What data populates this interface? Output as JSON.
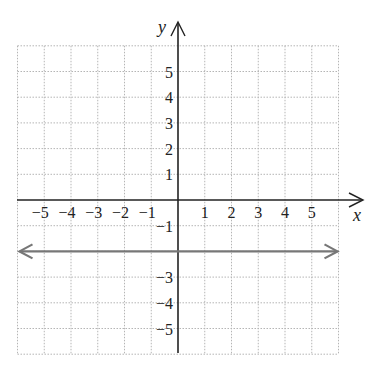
{
  "chart_data": {
    "type": "line",
    "title": "",
    "xlabel": "x",
    "ylabel": "y",
    "xlim": [
      -6,
      6
    ],
    "ylim": [
      -6,
      6
    ],
    "grid": true,
    "grid_style": "dotted",
    "x_ticks": [
      -5,
      -4,
      -3,
      -2,
      -1,
      1,
      2,
      3,
      4,
      5
    ],
    "x_tick_labels": [
      "−5",
      "−4",
      "−3",
      "−2",
      "−1",
      "1",
      "2",
      "3",
      "4",
      "5"
    ],
    "y_ticks": [
      5,
      4,
      3,
      2,
      1,
      -1,
      -3,
      -4,
      -5
    ],
    "y_tick_labels": [
      "5",
      "4",
      "3",
      "2",
      "1",
      "−1",
      "−3",
      "−4",
      "−5"
    ],
    "series": [
      {
        "name": "y = -2",
        "equation": "y = -2",
        "x": [
          -6,
          6
        ],
        "values": [
          -2,
          -2
        ],
        "color": "#777777",
        "arrows": "both"
      }
    ],
    "legend": null
  },
  "colors": {
    "axis": "#222222",
    "grid": "#b5b5b5",
    "line": "#777777"
  }
}
